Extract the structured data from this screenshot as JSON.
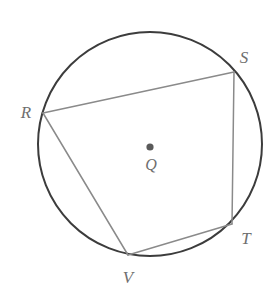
{
  "figure": {
    "kind": "geometry-diagram",
    "width": 280,
    "height": 296,
    "background_color": "#ffffff"
  },
  "colors": {
    "circle_stroke": "#3c3c3c",
    "chord_stroke": "#8a8a8a",
    "label_text": "#6f6f6f",
    "center_dot": "#5a5a5a",
    "background": "#ffffff"
  },
  "circle": {
    "name": "circle-q",
    "center_x": 150,
    "center_y": 144,
    "radius": 112,
    "stroke_width": 2
  },
  "center_point": {
    "name": "Q",
    "label": "Q",
    "dot_x": 150,
    "dot_y": 147,
    "dot_radius": 3.6,
    "label_x": 151,
    "label_y": 165
  },
  "vertices": [
    {
      "name": "R",
      "label": "R",
      "x": 43,
      "y": 113,
      "label_x": 26,
      "label_y": 112
    },
    {
      "name": "S",
      "label": "S",
      "x": 234,
      "y": 72,
      "label_x": 244,
      "label_y": 57
    },
    {
      "name": "T",
      "label": "T",
      "x": 232,
      "y": 224,
      "label_x": 246,
      "label_y": 238
    },
    {
      "name": "V",
      "label": "V",
      "x": 128,
      "y": 255,
      "label_x": 128,
      "label_y": 277
    }
  ],
  "segments": [
    {
      "name": "chord-RS",
      "label": "RS",
      "x1": 43,
      "y1": 113,
      "x2": 234,
      "y2": 72,
      "stroke_width": 1.5
    },
    {
      "name": "chord-ST",
      "label": "ST",
      "x1": 234,
      "y1": 72,
      "x2": 232,
      "y2": 224,
      "stroke_width": 1.5
    },
    {
      "name": "chord-TV",
      "label": "TV",
      "x1": 232,
      "y1": 224,
      "x2": 128,
      "y2": 255,
      "stroke_width": 1.5
    },
    {
      "name": "chord-VR",
      "label": "VR",
      "x1": 128,
      "y1": 255,
      "x2": 43,
      "y2": 113,
      "stroke_width": 1.5
    }
  ]
}
